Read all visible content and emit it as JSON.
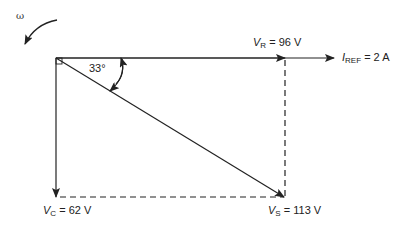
{
  "diagram": {
    "title": "",
    "rotation_label": "ω",
    "angle_label": "33°",
    "vectors": {
      "VR": {
        "symbol": "V",
        "sub": "R",
        "value": "= 96 V"
      },
      "IREF": {
        "symbol": "I",
        "sub": "REF",
        "value": "= 2 A"
      },
      "VC": {
        "symbol": "V",
        "sub": "C",
        "value": "= 62 V"
      },
      "VS": {
        "symbol": "V",
        "sub": "S",
        "value": "= 113 V"
      }
    },
    "colors": {
      "line": "#222222",
      "background": "#ffffff"
    }
  }
}
